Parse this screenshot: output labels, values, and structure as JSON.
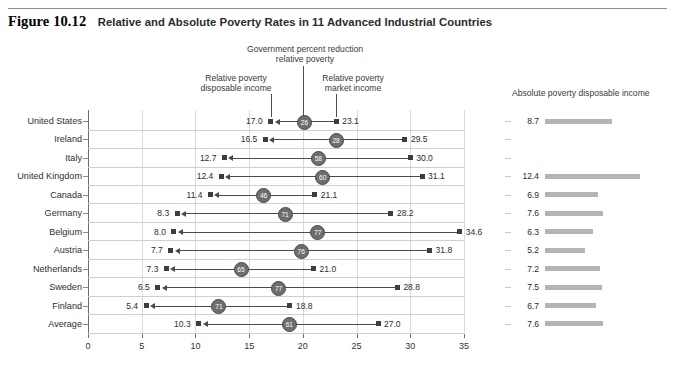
{
  "figure": {
    "number": "Figure 10.12",
    "title": "Relative and Absolute Poverty Rates in 11 Advanced Industrial Countries"
  },
  "annotations": {
    "government_reduction": "Government percent reduction\nrelative poverty",
    "government_reduction_line1": "Government percent reduction",
    "government_reduction_line2": "relative poverty",
    "relative_disposable_line1": "Relative poverty",
    "relative_disposable_line2": "disposable income",
    "relative_market_line1": "Relative poverty",
    "relative_market_line2": "market income",
    "absolute_panel_header": "Absolute poverty disposable income"
  },
  "chart_data": {
    "type": "bar",
    "title": "Relative and Absolute Poverty Rates in 11 Advanced Industrial Countries",
    "xlabel": "",
    "ylabel": "",
    "xlim": [
      0,
      35
    ],
    "xticks": [
      "0",
      "5",
      "10",
      "15",
      "20",
      "25",
      "30",
      "35"
    ],
    "grid": true,
    "legend_position": "top-annotations",
    "categories": [
      "United States",
      "Ireland",
      "Italy",
      "United Kingdom",
      "Canada",
      "Germany",
      "Belgium",
      "Austria",
      "Netherlands",
      "Sweden",
      "Finland",
      "Average"
    ],
    "series": [
      {
        "name": "Relative poverty disposable income",
        "values": [
          17.0,
          16.5,
          12.7,
          12.4,
          11.4,
          8.3,
          8.0,
          7.7,
          7.3,
          6.5,
          5.4,
          10.3
        ]
      },
      {
        "name": "Relative poverty market income",
        "values": [
          23.1,
          29.5,
          30.0,
          31.1,
          21.1,
          28.2,
          34.6,
          31.8,
          21.0,
          28.8,
          18.8,
          27.0
        ]
      },
      {
        "name": "Government percent reduction relative poverty",
        "values": [
          26,
          28,
          58,
          60,
          46,
          71,
          77,
          76,
          65,
          77,
          71,
          61
        ]
      },
      {
        "name": "Absolute poverty disposable income",
        "values": [
          8.7,
          null,
          null,
          12.4,
          6.9,
          7.6,
          6.3,
          5.2,
          7.2,
          7.5,
          6.7,
          7.6
        ]
      }
    ]
  },
  "rows": [
    {
      "label": "United States",
      "disposable": "17.0",
      "market": "23.1",
      "reduction": "26",
      "absolute": "8.7"
    },
    {
      "label": "Ireland",
      "disposable": "16.5",
      "market": "29.5",
      "reduction": "28",
      "absolute": ""
    },
    {
      "label": "Italy",
      "disposable": "12.7",
      "market": "30.0",
      "reduction": "58",
      "absolute": ""
    },
    {
      "label": "United Kingdom",
      "disposable": "12.4",
      "market": "31.1",
      "reduction": "60",
      "absolute": "12.4"
    },
    {
      "label": "Canada",
      "disposable": "11.4",
      "market": "21.1",
      "reduction": "46",
      "absolute": "6.9"
    },
    {
      "label": "Germany",
      "disposable": "8.3",
      "market": "28.2",
      "reduction": "71",
      "absolute": "7.6"
    },
    {
      "label": "Belgium",
      "disposable": "8.0",
      "market": "34.6",
      "reduction": "77",
      "absolute": "6.3"
    },
    {
      "label": "Austria",
      "disposable": "7.7",
      "market": "31.8",
      "reduction": "76",
      "absolute": "5.2"
    },
    {
      "label": "Netherlands",
      "disposable": "7.3",
      "market": "21.0",
      "reduction": "65",
      "absolute": "7.2"
    },
    {
      "label": "Sweden",
      "disposable": "6.5",
      "market": "28.8",
      "reduction": "77",
      "absolute": "7.5"
    },
    {
      "label": "Finland",
      "disposable": "5.4",
      "market": "18.8",
      "reduction": "71",
      "absolute": "6.7"
    },
    {
      "label": "Average",
      "disposable": "10.3",
      "market": "27.0",
      "reduction": "61",
      "absolute": "7.6"
    }
  ],
  "colors": {
    "marker": "#3d3d3d",
    "circle": "#6e6e6e",
    "bar": "#b4b4b4",
    "axis": "#6f6f6f",
    "grid": "#d9d9d9"
  }
}
